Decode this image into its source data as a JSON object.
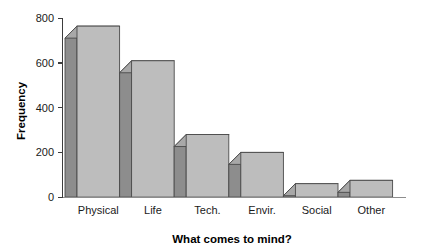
{
  "chart_data": {
    "type": "bar",
    "title": "",
    "subtitle": "",
    "xlabel": "What comes to mind?",
    "ylabel": "Frequency",
    "categories": [
      "Physical",
      "Life",
      "Tech.",
      "Envir.",
      "Social",
      "Other"
    ],
    "values": [
      765,
      610,
      280,
      200,
      60,
      75
    ],
    "series": [
      {
        "name": "Frequency",
        "values": [
          765,
          610,
          280,
          200,
          60,
          75
        ]
      }
    ],
    "ylim": [
      0,
      800
    ],
    "yticks": [
      0,
      200,
      400,
      600,
      800
    ],
    "ytick_labels": [
      "0",
      "200",
      "400",
      "600",
      "800"
    ],
    "grid": false,
    "legend": false,
    "legend_position": "none",
    "style": "3d-shaded-bars",
    "colors": {
      "bar_front": "#bdbdbd",
      "bar_side": "#8d8d8d",
      "bar_top": "#a8a8a8",
      "bar_outline": "#4a4a4a",
      "axis": "#3d3d3d",
      "text": "#1a1a1a",
      "background": "#ffffff"
    }
  },
  "axes": {
    "y_title": "Frequency",
    "x_title": "What comes to mind?"
  }
}
